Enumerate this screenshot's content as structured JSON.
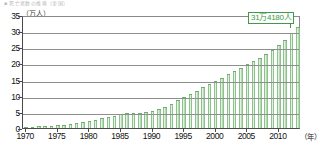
{
  "title_strip": "■ 死亡者数の推移（全国）",
  "axis": {
    "y_unit": "（万人）",
    "x_unit": "（年）",
    "y_ticks": [
      "0",
      "5",
      "10",
      "15",
      "20",
      "25",
      "30",
      "35"
    ],
    "x_ticks": [
      "1970",
      "1975",
      "1980",
      "1985",
      "1990",
      "1995",
      "2000",
      "2005",
      "2010"
    ]
  },
  "callout": {
    "label": "31万4180人",
    "color": "#3f9a4a"
  },
  "colors": {
    "bar": "#8cc38c",
    "bar_light": "#e4f1e2",
    "bar_edge": "#6fae6f",
    "axis": "#4a4a4a",
    "grid": "#8f8f8f"
  },
  "chart_data": {
    "type": "bar",
    "title": "死亡者数の推移（全国）",
    "xlabel": "（年）",
    "ylabel": "（万人）",
    "ylim": [
      0,
      35
    ],
    "xlim": [
      1970,
      2013
    ],
    "grid": true,
    "legend": "none",
    "annotations": [
      {
        "text": "31万4180人",
        "x": 2013,
        "y": 31.4
      }
    ],
    "categories": [
      "1970",
      "1971",
      "1972",
      "1973",
      "1974",
      "1975",
      "1976",
      "1977",
      "1978",
      "1979",
      "1980",
      "1981",
      "1982",
      "1983",
      "1984",
      "1985",
      "1986",
      "1987",
      "1988",
      "1989",
      "1990",
      "1991",
      "1992",
      "1993",
      "1994",
      "1995",
      "1996",
      "1997",
      "1998",
      "1999",
      "2000",
      "2001",
      "2002",
      "2003",
      "2004",
      "2005",
      "2006",
      "2007",
      "2008",
      "2009",
      "2010",
      "2011",
      "2012",
      "2013"
    ],
    "values": [
      0.3,
      0.4,
      0.5,
      0.6,
      0.7,
      0.8,
      1.0,
      1.2,
      1.5,
      1.8,
      2.2,
      2.6,
      3.0,
      3.4,
      3.8,
      4.3,
      4.5,
      4.6,
      4.8,
      5.0,
      5.3,
      5.8,
      6.4,
      7.5,
      8.6,
      9.6,
      10.6,
      11.6,
      12.6,
      13.6,
      14.6,
      15.6,
      16.6,
      17.6,
      18.6,
      19.8,
      20.8,
      21.8,
      23.0,
      24.2,
      25.6,
      27.2,
      29.3,
      31.4
    ]
  }
}
